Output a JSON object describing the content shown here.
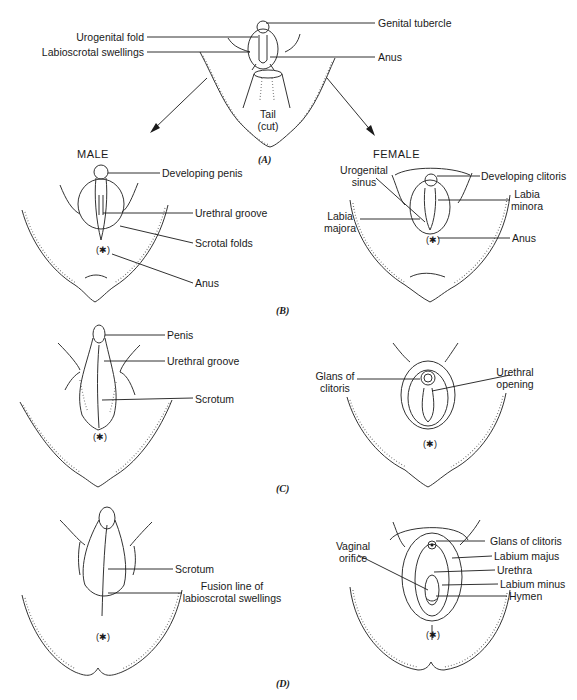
{
  "figure": {
    "headers": {
      "male": "MALE",
      "female": "FEMALE"
    },
    "panels": [
      "(A)",
      "(B)",
      "(C)",
      "(D)"
    ],
    "A": {
      "labels": {
        "genital_tubercle": "Genital tubercle",
        "urogenital_fold": "Urogenital fold",
        "labioscrotal_swellings": "Labioscrotal swellings",
        "anus": "Anus",
        "tail_line1": "Tail",
        "tail_line2": "(cut)"
      }
    },
    "B_male": {
      "labels": {
        "developing_penis": "Developing penis",
        "urethral_groove": "Urethral groove",
        "scrotal_folds": "Scrotal folds",
        "anus": "Anus"
      }
    },
    "B_female": {
      "labels": {
        "urogenital_sinus_line1": "Urogenital",
        "urogenital_sinus_line2": "sinus",
        "developing_clitoris": "Developing clitoris",
        "labia_minora_line1": "Labia",
        "labia_minora_line2": "minora",
        "labia_majora_line1": "Labia",
        "labia_majora_line2": "majora",
        "anus": "Anus"
      }
    },
    "C_male": {
      "labels": {
        "penis": "Penis",
        "urethral_groove": "Urethral groove",
        "scrotum": "Scrotum"
      }
    },
    "C_female": {
      "labels": {
        "glans_line1": "Glans of",
        "glans_line2": "clitoris",
        "urethral_opening_line1": "Urethral",
        "urethral_opening_line2": "opening"
      }
    },
    "D_male": {
      "labels": {
        "scrotum": "Scrotum",
        "fusion_line1": "Fusion line of",
        "fusion_line2": "labioscrotal swellings"
      }
    },
    "D_female": {
      "labels": {
        "vaginal_orifice_line1": "Vaginal",
        "vaginal_orifice_line2": "orifice",
        "glans_of_clitoris": "Glans of clitoris",
        "labium_majus": "Labium majus",
        "urethra": "Urethra",
        "labium_minus": "Labium minus",
        "hymen": "Hymen"
      }
    }
  }
}
